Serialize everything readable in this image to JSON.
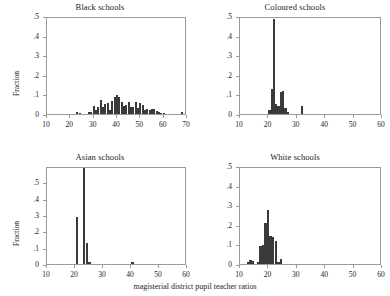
{
  "figure": {
    "xlabel": "magisterial district pupil teacher ratios",
    "ylabel": "Fraction"
  },
  "chart_data": [
    {
      "type": "bar",
      "title": "Black schools",
      "xlabel": "",
      "ylabel": "Fraction",
      "xlim": [
        10,
        70
      ],
      "ylim": [
        0,
        0.5
      ],
      "xticks": [
        "10",
        "20",
        "30",
        "40",
        "50",
        "60",
        "70"
      ],
      "xtick_values": [
        10,
        20,
        30,
        40,
        50,
        60,
        70
      ],
      "yticks": [
        "0",
        ".1",
        ".2",
        ".3",
        ".4",
        ".5"
      ],
      "ytick_values": [
        0,
        0.1,
        0.2,
        0.3,
        0.4,
        0.5
      ],
      "grid": false,
      "bin_width": 1,
      "x": [
        23,
        24,
        28,
        29,
        30,
        31,
        32,
        33,
        34,
        35,
        36,
        37,
        38,
        39,
        40,
        41,
        42,
        43,
        44,
        45,
        46,
        47,
        48,
        49,
        50,
        51,
        52,
        53,
        54,
        55,
        56,
        57,
        58,
        59,
        60,
        68
      ],
      "values": [
        0.008,
        0.006,
        0.009,
        0.012,
        0.042,
        0.02,
        0.035,
        0.073,
        0.035,
        0.05,
        0.057,
        0.02,
        0.068,
        0.085,
        0.095,
        0.088,
        0.06,
        0.042,
        0.044,
        0.06,
        0.036,
        0.036,
        0.06,
        0.03,
        0.054,
        0.044,
        0.02,
        0.026,
        0.02,
        0.028,
        0.024,
        0.014,
        0.009,
        0.006,
        0.004,
        0.008
      ]
    },
    {
      "type": "bar",
      "title": "Coloured schools",
      "xlabel": "",
      "ylabel": "",
      "xlim": [
        10,
        60
      ],
      "ylim": [
        0,
        0.5
      ],
      "xticks": [
        "10",
        "20",
        "30",
        "40",
        "50",
        "60"
      ],
      "xtick_values": [
        10,
        20,
        30,
        40,
        50,
        60
      ],
      "yticks": [
        "0",
        ".1",
        ".2",
        ".3",
        ".4",
        ".5"
      ],
      "ytick_values": [
        0,
        0.1,
        0.2,
        0.3,
        0.4,
        0.5
      ],
      "grid": false,
      "bin_width": 0.8,
      "x": [
        20.4,
        21.2,
        22.0,
        22.8,
        23.6,
        24.4,
        25.2,
        26.0,
        26.8,
        31.8
      ],
      "values": [
        0.022,
        0.13,
        0.485,
        0.052,
        0.04,
        0.11,
        0.118,
        0.03,
        0.012,
        0.04
      ]
    },
    {
      "type": "bar",
      "title": "Asian schools",
      "xlabel": "",
      "ylabel": "Fraction",
      "xlim": [
        10,
        60
      ],
      "ylim": [
        0,
        0.6
      ],
      "xticks": [
        "10",
        "20",
        "30",
        "40",
        "50",
        "60"
      ],
      "xtick_values": [
        10,
        20,
        30,
        40,
        50,
        60
      ],
      "yticks": [
        "0",
        ".1",
        ".2",
        ".3",
        ".4",
        ".5"
      ],
      "ytick_values": [
        0,
        0.1,
        0.2,
        0.3,
        0.4,
        0.5
      ],
      "grid": false,
      "bin_width": 0.9,
      "x": [
        20.7,
        23.3,
        24.2,
        25.1,
        40.6
      ],
      "values": [
        0.288,
        0.595,
        0.13,
        0.015,
        0.015
      ]
    },
    {
      "type": "bar",
      "title": "White schools",
      "xlabel": "",
      "ylabel": "",
      "xlim": [
        10,
        60
      ],
      "ylim": [
        0,
        0.5
      ],
      "xticks": [
        "10",
        "20",
        "30",
        "40",
        "50",
        "60"
      ],
      "xtick_values": [
        10,
        20,
        30,
        40,
        50,
        60
      ],
      "yticks": [
        "0",
        ".1",
        ".2",
        ".3",
        ".4",
        ".5"
      ],
      "ytick_values": [
        0,
        0.1,
        0.2,
        0.3,
        0.4,
        0.5
      ],
      "grid": false,
      "bin_width": 0.85,
      "x": [
        12.8,
        13.7,
        14.6,
        16.3,
        17.2,
        18.1,
        19.0,
        19.9,
        20.8,
        21.7,
        22.6,
        23.5,
        24.4
      ],
      "values": [
        0.01,
        0.018,
        0.014,
        0.008,
        0.092,
        0.095,
        0.208,
        0.275,
        0.142,
        0.138,
        0.118,
        0.012,
        0.026
      ]
    }
  ],
  "panels": [
    {
      "title": "Black schools",
      "ylabel": "Fraction"
    },
    {
      "title": "Coloured schools",
      "ylabel": ""
    },
    {
      "title": "Asian schools",
      "ylabel": "Fraction"
    },
    {
      "title": "White schools",
      "ylabel": ""
    }
  ]
}
